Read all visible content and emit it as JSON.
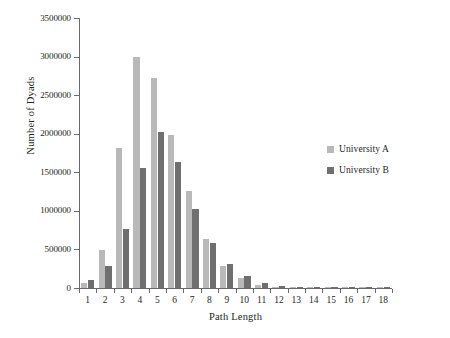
{
  "chart_data": {
    "type": "bar",
    "title": "",
    "xlabel": "Path Length",
    "ylabel": "Number of Dyads",
    "categories": [
      "1",
      "2",
      "3",
      "4",
      "5",
      "6",
      "7",
      "8",
      "9",
      "10",
      "11",
      "12",
      "13",
      "14",
      "15",
      "16",
      "17",
      "18"
    ],
    "ylim": [
      0,
      3500000
    ],
    "ytick_labels": [
      "0",
      "500000",
      "1000000",
      "1500000",
      "2000000",
      "2500000",
      "3000000",
      "3500000"
    ],
    "ytick_values": [
      0,
      500000,
      1000000,
      1500000,
      2000000,
      2500000,
      3000000,
      3500000
    ],
    "grid": false,
    "legend_position": "right",
    "series": [
      {
        "name": "University A",
        "color": "#b9b9b9",
        "values": [
          70000,
          490000,
          1820000,
          3000000,
          2720000,
          1980000,
          1260000,
          640000,
          285000,
          125000,
          40000,
          12000,
          5000,
          2000,
          1000,
          500,
          300,
          200
        ]
      },
      {
        "name": "University B",
        "color": "#6f6f6f",
        "values": [
          100000,
          285000,
          765000,
          1550000,
          2020000,
          1640000,
          1020000,
          585000,
          310000,
          155000,
          60000,
          20000,
          7000,
          3000,
          1500,
          900,
          400,
          200
        ]
      }
    ]
  },
  "legend": {
    "items": [
      {
        "label": "University A",
        "color": "#b9b9b9"
      },
      {
        "label": "University B",
        "color": "#6f6f6f"
      }
    ]
  },
  "axes": {
    "y_title": "Number of Dyads",
    "x_title": "Path Length"
  }
}
